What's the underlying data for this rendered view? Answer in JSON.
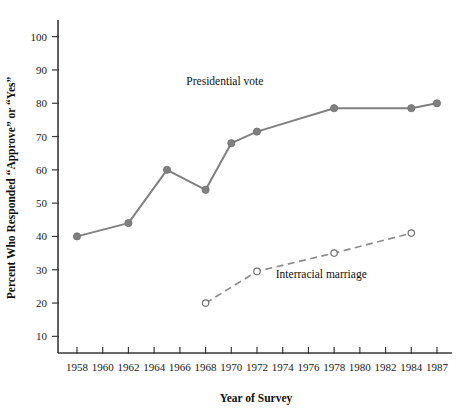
{
  "chart_data": {
    "type": "line",
    "title": "",
    "xlabel": "Year of Survey",
    "ylabel": "Percent Who Responded “Approve” or “Yes”",
    "xlim": [
      1957,
      1988
    ],
    "ylim": [
      5,
      105
    ],
    "ytick_labels": [
      "10",
      "20",
      "30",
      "40",
      "50",
      "60",
      "70",
      "80",
      "90",
      "100"
    ],
    "ytick_values": [
      10,
      20,
      30,
      40,
      50,
      60,
      70,
      80,
      90,
      100
    ],
    "xtick_labels": [
      "1958",
      "1960",
      "1962",
      "1964",
      "1966",
      "1968",
      "1970",
      "1972",
      "1974",
      "1976",
      "1978",
      "1980",
      "1982",
      "1984",
      "1987"
    ],
    "xtick_values": [
      1958,
      1960,
      1962,
      1964,
      1966,
      1968,
      1970,
      1972,
      1974,
      1976,
      1978,
      1980,
      1982,
      1984,
      1987
    ],
    "grid": false,
    "legend_position": "inline-annotation",
    "series": [
      {
        "name": "Presidential vote",
        "style": "solid",
        "marker": "filled-circle",
        "color": "#808080",
        "x": [
          1958,
          1962,
          1965,
          1968,
          1970,
          1972,
          1978,
          1984,
          1987
        ],
        "values": [
          40,
          44,
          60,
          54,
          68,
          71.5,
          78.5,
          78.5,
          80
        ]
      },
      {
        "name": "Interracial marriage",
        "style": "dashed",
        "marker": "open-circle",
        "color": "#8c8c8c",
        "x": [
          1968,
          1972,
          1978,
          1984
        ],
        "values": [
          20,
          29.5,
          35,
          41
        ]
      }
    ],
    "annotations": [
      {
        "text": "Presidential vote",
        "x": 1969.5,
        "y": 85.5
      },
      {
        "text": "Interracial marriage",
        "x": 1977.0,
        "y": 27.5
      }
    ]
  },
  "colors": {
    "axis": "#3a3a3a",
    "text": "#111111",
    "presidential_vote": "#808080",
    "interracial_marriage": "#8c8c8c",
    "background": "#ffffff"
  }
}
